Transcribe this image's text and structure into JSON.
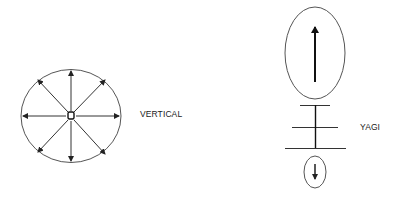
{
  "diagram": {
    "title": "",
    "colors": {
      "stroke": "#333333",
      "text": "#1a1a1a",
      "background": "#ffffff"
    },
    "vertical": {
      "label": "VERTICAL",
      "pattern": "omnidirectional",
      "arrow_directions": [
        "N",
        "NE",
        "E",
        "SE",
        "S",
        "SW",
        "W",
        "NW"
      ]
    },
    "yagi": {
      "label": "YAGI",
      "pattern": "directional",
      "main_lobe_arrow": "up",
      "back_lobe_arrow": "down",
      "elements": 3
    }
  }
}
